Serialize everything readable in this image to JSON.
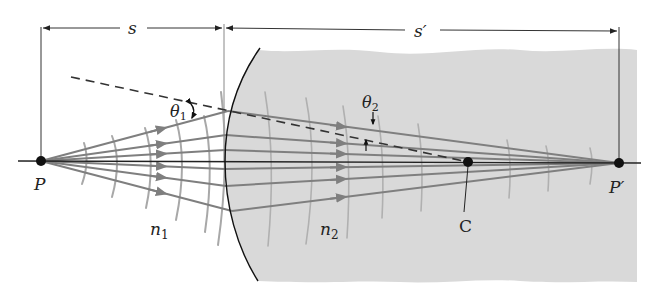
{
  "figure": {
    "colors": {
      "background": "#ffffff",
      "medium2_fill": "#d9d9d9",
      "ray": "#7f7f7f",
      "wavefront": "#a8a8a8",
      "axis": "#222222",
      "interface": "#111111",
      "dimension": "#333333"
    },
    "labels": {
      "object_distance": "s",
      "image_distance": "s′",
      "object_point": "P",
      "image_point": "P′",
      "center_of_curvature": "C",
      "index_medium_1": "n",
      "index_medium_1_sub": "1",
      "index_medium_2": "n",
      "index_medium_2_sub": "2",
      "incidence_angle": "θ",
      "incidence_angle_sub": "1",
      "refraction_angle": "θ",
      "refraction_angle_sub": "2"
    },
    "points": {
      "P": [
        41,
        161
      ],
      "C": [
        468,
        162
      ],
      "P_prime": [
        619,
        163
      ],
      "vertex": [
        225,
        161
      ]
    }
  }
}
